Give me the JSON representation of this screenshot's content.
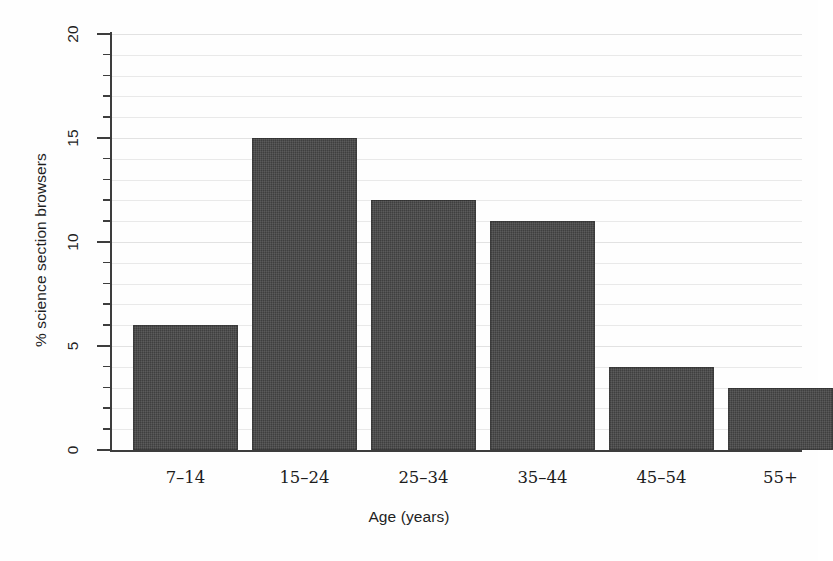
{
  "chart_data": {
    "type": "bar",
    "title": "",
    "categories": [
      "7–14",
      "15–24",
      "25–34",
      "35–44",
      "45–54",
      "55+"
    ],
    "values": [
      6,
      15,
      12,
      11,
      4,
      3
    ],
    "xlabel": "Age (years)",
    "ylabel": "% science section browsers",
    "ylim": [
      0,
      20
    ],
    "y_major_ticks": [
      0,
      5,
      10,
      15,
      20
    ],
    "y_major_tick_labels": [
      "0",
      "5",
      "10",
      "15",
      "20"
    ],
    "y_minor_tick_interval": 1,
    "grid": true,
    "grid_orientation": "horizontal",
    "legend": "none",
    "bar_color": "#454545",
    "grid_color": "#e9e9e9",
    "axis_color": "#3d3d3d",
    "background_color": "#ffffff"
  }
}
